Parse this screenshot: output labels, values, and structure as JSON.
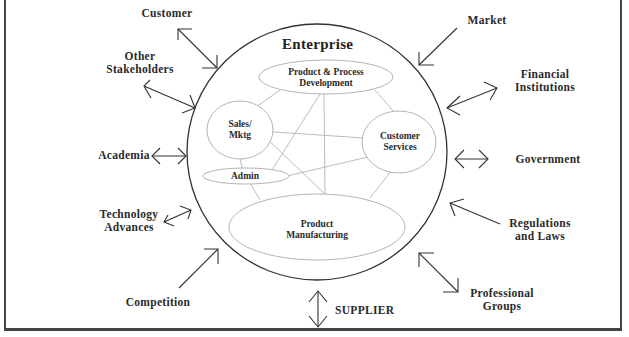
{
  "diagram": {
    "title": "Enterprise",
    "internal_units": [
      {
        "id": "ppd",
        "label": "Product & Process\nDevelopment"
      },
      {
        "id": "sales",
        "label": "Sales/\nMktg"
      },
      {
        "id": "cs",
        "label": "Customer\nServices"
      },
      {
        "id": "admin",
        "label": "Admin"
      },
      {
        "id": "pm",
        "label": "Product\nManufacturing"
      }
    ],
    "internal_links": [
      [
        "ppd",
        "sales"
      ],
      [
        "ppd",
        "cs"
      ],
      [
        "ppd",
        "pm"
      ],
      [
        "ppd",
        "admin"
      ],
      [
        "sales",
        "cs"
      ],
      [
        "sales",
        "pm"
      ],
      [
        "sales",
        "admin"
      ],
      [
        "admin",
        "cs"
      ],
      [
        "admin",
        "pm"
      ],
      [
        "cs",
        "pm"
      ]
    ],
    "external_factors": [
      {
        "id": "customer",
        "label": "Customer",
        "arrow": "bidirectional"
      },
      {
        "id": "other",
        "label": "Other\nStakeholders",
        "arrow": "bidirectional"
      },
      {
        "id": "academia",
        "label": "Academia",
        "arrow": "bidirectional"
      },
      {
        "id": "tech",
        "label": "Technology\nAdvances",
        "arrow": "bidirectional"
      },
      {
        "id": "competition",
        "label": "Competition",
        "arrow": "inward"
      },
      {
        "id": "supplier",
        "label": "SUPPLIER",
        "arrow": "bidirectional"
      },
      {
        "id": "professional",
        "label": "Professional\nGroups",
        "arrow": "bidirectional"
      },
      {
        "id": "regulations",
        "label": "Regulations\nand Laws",
        "arrow": "inward"
      },
      {
        "id": "government",
        "label": "Government",
        "arrow": "bidirectional"
      },
      {
        "id": "financial",
        "label": "Financial\nInstitutions",
        "arrow": "bidirectional"
      },
      {
        "id": "market",
        "label": "Market",
        "arrow": "inward"
      }
    ]
  }
}
